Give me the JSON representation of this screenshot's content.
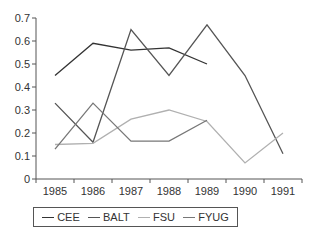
{
  "chart_data": {
    "type": "line",
    "title": "",
    "xlabel": "",
    "ylabel": "",
    "categories": [
      "1985",
      "1986",
      "1987",
      "1988",
      "1989",
      "1990",
      "1991"
    ],
    "ylim": [
      0,
      0.7
    ],
    "yticks": [
      "0",
      "0.1",
      "0.2",
      "0.3",
      "0.4",
      "0.5",
      "0.6",
      "0.7"
    ],
    "grid": false,
    "legend_position": "bottom",
    "series": [
      {
        "name": "CEE",
        "color": "#333333",
        "values": [
          0.45,
          0.59,
          0.56,
          0.57,
          0.5,
          null,
          null
        ]
      },
      {
        "name": "BALT",
        "color": "#555555",
        "values": [
          0.33,
          0.16,
          0.65,
          0.45,
          0.67,
          0.45,
          0.11
        ]
      },
      {
        "name": "FSU",
        "color": "#b0b0b0",
        "values": [
          0.15,
          0.155,
          0.26,
          0.3,
          0.25,
          0.07,
          0.2
        ]
      },
      {
        "name": "FYUG",
        "color": "#777777",
        "values": [
          0.13,
          0.33,
          0.165,
          0.165,
          0.255,
          null,
          null
        ]
      }
    ]
  },
  "legend": {
    "items": [
      {
        "label": "CEE",
        "color": "#333333"
      },
      {
        "label": "BALT",
        "color": "#555555"
      },
      {
        "label": "FSU",
        "color": "#b0b0b0"
      },
      {
        "label": "FYUG",
        "color": "#777777"
      }
    ]
  }
}
